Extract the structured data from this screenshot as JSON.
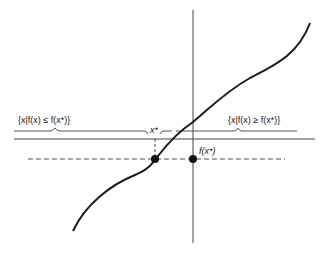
{
  "diagram": {
    "title": "",
    "labels": {
      "left_set": "{x|f(x) ≤ f(x*)}",
      "right_set": "{x|f(x) ≥ f(x*)}",
      "x_star": "x*",
      "f_x_star": "f(x*)"
    },
    "elements": {
      "curve": "monotonically increasing function f(x)",
      "vertical_axis": "f-axis",
      "horizontal_axis": "x-axis",
      "dashed_level_line": "level f(x*)",
      "point_on_curve": "(x*, f(x*))",
      "point_on_axis": "f(x*)"
    },
    "colors": {
      "stroke": "#1a1a1a",
      "axis": "#444444",
      "background": "#ffffff"
    }
  }
}
